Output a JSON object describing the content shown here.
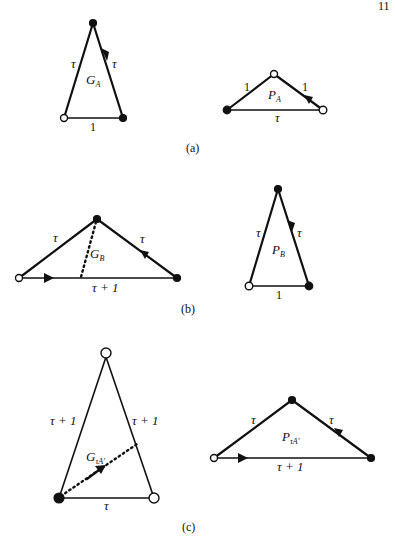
{
  "page_mark": "11",
  "panels": [
    {
      "id": "a",
      "caption": "(a)",
      "left": {
        "name": "G",
        "subscript": "A",
        "edges": [
          {
            "label": "τ",
            "side": "left"
          },
          {
            "label": "τ",
            "side": "right",
            "arrow": "down"
          },
          {
            "label": "1",
            "side": "base"
          }
        ]
      },
      "right": {
        "name": "P",
        "subscript": "A",
        "edges": [
          {
            "label": "1",
            "side": "left"
          },
          {
            "label": "1",
            "side": "right",
            "arrow": "up-left"
          },
          {
            "label": "τ",
            "side": "base"
          }
        ]
      }
    },
    {
      "id": "b",
      "caption": "(b)",
      "left": {
        "name": "G",
        "subscript": "B",
        "edges": [
          {
            "label": "τ",
            "side": "left"
          },
          {
            "label": "τ",
            "side": "right",
            "arrow": "up-left"
          },
          {
            "label": "τ + 1",
            "side": "base",
            "arrow": "right"
          }
        ]
      },
      "right": {
        "name": "P",
        "subscript": "B",
        "edges": [
          {
            "label": "τ",
            "side": "left"
          },
          {
            "label": "τ",
            "side": "right",
            "arrow": "down"
          },
          {
            "label": "1",
            "side": "base"
          }
        ]
      }
    },
    {
      "id": "c",
      "caption": "(c)",
      "left": {
        "name": "G",
        "subscript": "τA'",
        "edges": [
          {
            "label": "τ + 1",
            "side": "left"
          },
          {
            "label": "τ + 1",
            "side": "right"
          },
          {
            "label": "τ",
            "side": "base"
          }
        ]
      },
      "right": {
        "name": "P",
        "subscript": "τA'",
        "edges": [
          {
            "label": "τ",
            "side": "left"
          },
          {
            "label": "τ",
            "side": "right",
            "arrow": "up-left"
          },
          {
            "label": "τ + 1",
            "side": "base",
            "arrow": "right"
          }
        ]
      }
    }
  ]
}
